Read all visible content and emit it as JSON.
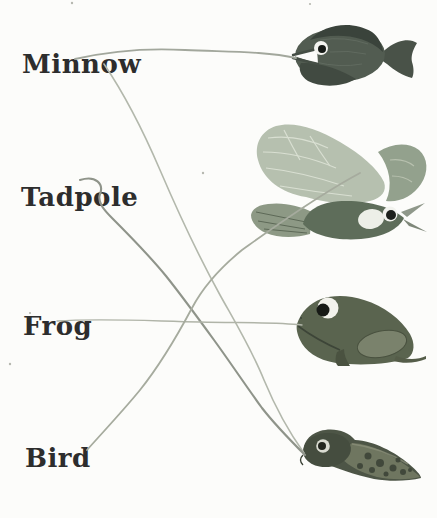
{
  "exercise": {
    "words": [
      {
        "text": "Minnow"
      },
      {
        "text": "Tadpole"
      },
      {
        "text": "Frog"
      },
      {
        "text": "Bird"
      }
    ],
    "pictures": [
      {
        "name": "fish"
      },
      {
        "name": "flying-bird"
      },
      {
        "name": "frog"
      },
      {
        "name": "tadpole"
      }
    ],
    "drawn_connections": [
      {
        "from": "Minnow",
        "to": "fish"
      },
      {
        "from": "Minnow",
        "to": "tadpole"
      },
      {
        "from": "Tadpole",
        "to": "tadpole"
      },
      {
        "from": "Frog",
        "to": "frog"
      },
      {
        "from": "Bird",
        "to": "flying-bird"
      }
    ],
    "colors": {
      "page_background": "#fcfcfa",
      "text_ink": "#2d2d2d",
      "pencil_line": "#a5aa9e",
      "pencil_line_dark": "#8f948a",
      "animal_dark_olive": "#4e584c",
      "animal_sage": "#b6c0af"
    }
  }
}
